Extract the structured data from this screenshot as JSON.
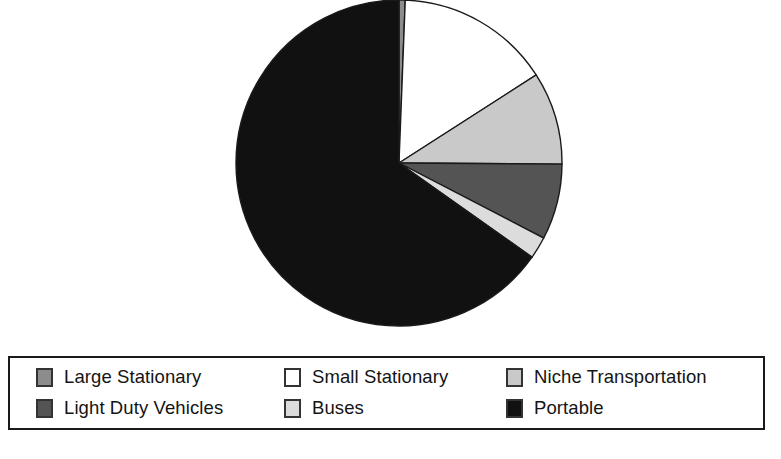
{
  "chart_data": {
    "type": "pie",
    "title": "",
    "subtitle": "",
    "xlabel": "",
    "ylabel": "",
    "legend_position": "bottom",
    "grid": false,
    "start_angle_deg": 0,
    "direction": "clockwise",
    "categories": [
      "Large Stationary",
      "Small Stationary",
      "Niche Transportation",
      "Light Duty Vehicles",
      "Buses",
      "Portable"
    ],
    "values": [
      0.6,
      15.3,
      9.2,
      7.5,
      2.2,
      65.2
    ],
    "unit": "percent",
    "slices": [
      {
        "label": "Large Stationary",
        "value": 0.6,
        "color": "#8c8c8c",
        "start_deg": 0.0,
        "end_deg": 2.2
      },
      {
        "label": "Small Stationary",
        "value": 15.3,
        "color": "#ffffff",
        "start_deg": 2.2,
        "end_deg": 57.3
      },
      {
        "label": "Niche Transportation",
        "value": 9.2,
        "color": "#c9c9c9",
        "start_deg": 57.3,
        "end_deg": 90.4
      },
      {
        "label": "Light Duty Vehicles",
        "value": 7.5,
        "color": "#545454",
        "start_deg": 90.4,
        "end_deg": 117.4
      },
      {
        "label": "Buses",
        "value": 2.2,
        "color": "#dcdcdc",
        "start_deg": 117.4,
        "end_deg": 125.3
      },
      {
        "label": "Portable",
        "value": 65.2,
        "color": "#111111",
        "start_deg": 125.3,
        "end_deg": 360.0
      }
    ],
    "geometry": {
      "center_x": 399,
      "center_y": 163,
      "radius": 163,
      "clipped_top": true
    },
    "stroke_color": "#1a1a1a",
    "stroke_width": 1.4
  },
  "legend": {
    "entries": [
      {
        "label": "Large Stationary",
        "swatch_color": "#8c8c8c"
      },
      {
        "label": "Small Stationary",
        "swatch_color": "#ffffff"
      },
      {
        "label": "Niche Transportation",
        "swatch_color": "#c9c9c9"
      },
      {
        "label": "Light Duty Vehicles",
        "swatch_color": "#545454"
      },
      {
        "label": "Buses",
        "swatch_color": "#dcdcdc"
      },
      {
        "label": "Portable",
        "swatch_color": "#111111"
      }
    ],
    "border_color": "#1a1a1a"
  },
  "caption": {
    "text": ""
  }
}
